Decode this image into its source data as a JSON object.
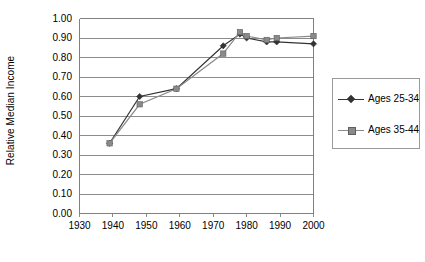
{
  "chart_data": {
    "type": "line",
    "title": "",
    "subtitle": "",
    "xlabel": "",
    "ylabel": "Relative Median Income",
    "xlim": [
      1930,
      2000
    ],
    "ylim": [
      0.0,
      1.0
    ],
    "grid": "horizontal",
    "legend_position": "right",
    "x_ticks": [
      1930,
      1940,
      1950,
      1960,
      1970,
      1980,
      1990,
      2000
    ],
    "x_tick_labels": [
      "1930",
      "1940",
      "1950",
      "1960",
      "1970",
      "1980",
      "1990",
      "2000"
    ],
    "y_ticks": [
      0.0,
      0.1,
      0.2,
      0.3,
      0.4,
      0.5,
      0.6,
      0.7,
      0.8,
      0.9,
      1.0
    ],
    "y_tick_labels": [
      "0.00",
      "0.10",
      "0.20",
      "0.30",
      "0.40",
      "0.50",
      "0.60",
      "0.70",
      "0.80",
      "0.90",
      "1.00"
    ],
    "series": [
      {
        "name": "Ages 25-34",
        "marker": "diamond",
        "color": "#333333",
        "x": [
          1939,
          1948,
          1959,
          1973,
          1978,
          1980,
          1986,
          1989,
          2000
        ],
        "values": [
          0.36,
          0.6,
          0.64,
          0.86,
          0.92,
          0.9,
          0.88,
          0.88,
          0.87
        ]
      },
      {
        "name": "Ages 35-44",
        "marker": "square",
        "color": "#8a8a8a",
        "x": [
          1939,
          1948,
          1959,
          1973,
          1978,
          1980,
          1986,
          1989,
          2000
        ],
        "values": [
          0.36,
          0.56,
          0.64,
          0.82,
          0.93,
          0.91,
          0.89,
          0.9,
          0.91
        ]
      }
    ]
  },
  "legend": {
    "entries": [
      {
        "label": "Ages 25-34"
      },
      {
        "label": "Ages 35-44"
      }
    ]
  },
  "colors": {
    "axis": "#808080",
    "grid": "#808080",
    "series_1": "#333333",
    "series_2": "#8a8a8a",
    "background": "#ffffff"
  }
}
